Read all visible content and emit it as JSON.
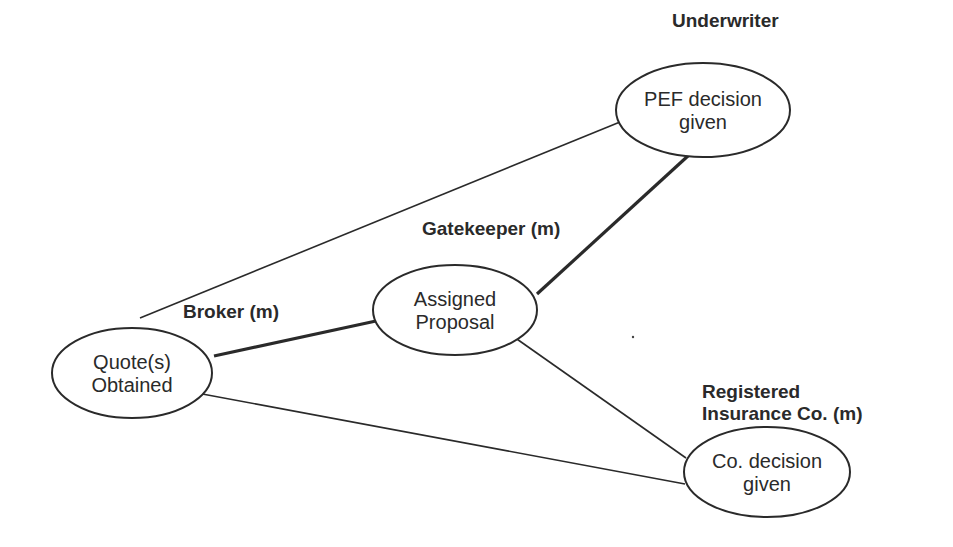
{
  "diagram": {
    "type": "process network",
    "nodes": [
      {
        "id": "quote",
        "lines": [
          "Quote(s)",
          "Obtained"
        ],
        "cx": 132,
        "cy": 373,
        "rx": 80,
        "ry": 45
      },
      {
        "id": "assigned",
        "lines": [
          "Assigned",
          "Proposal"
        ],
        "cx": 455,
        "cy": 310,
        "rx": 82,
        "ry": 45
      },
      {
        "id": "pef",
        "lines": [
          "PEF decision",
          "given"
        ],
        "cx": 703,
        "cy": 110,
        "rx": 87,
        "ry": 47
      },
      {
        "id": "co",
        "lines": [
          "Co. decision",
          "given"
        ],
        "cx": 767,
        "cy": 472,
        "rx": 83,
        "ry": 45
      }
    ],
    "roles": [
      {
        "id": "underwriter",
        "lines": [
          "Underwriter"
        ],
        "x": 672,
        "y": 27
      },
      {
        "id": "gatekeeper",
        "lines": [
          "Gatekeeper (m)"
        ],
        "x": 422,
        "y": 235
      },
      {
        "id": "broker",
        "lines": [
          "Broker (m)"
        ],
        "x": 183,
        "y": 318
      },
      {
        "id": "registered",
        "lines": [
          "Registered",
          "Insurance Co. (m)"
        ],
        "x": 702,
        "y": 398
      }
    ],
    "edges": [
      {
        "from": "quote",
        "to": "pef",
        "weight": "thin",
        "x1": 140,
        "y1": 318,
        "x2": 620,
        "y2": 122
      },
      {
        "from": "quote",
        "to": "assigned",
        "weight": "thick",
        "x1": 214,
        "y1": 356,
        "x2": 376,
        "y2": 321
      },
      {
        "from": "assigned",
        "to": "pef",
        "weight": "thick",
        "x1": 537,
        "y1": 294,
        "x2": 689,
        "y2": 155
      },
      {
        "from": "assigned",
        "to": "co",
        "weight": "thin",
        "x1": 514,
        "y1": 337,
        "x2": 686,
        "y2": 458
      },
      {
        "from": "quote",
        "to": "co",
        "weight": "thin",
        "x1": 197,
        "y1": 393,
        "x2": 685,
        "y2": 484
      }
    ],
    "colors": {
      "stroke": "#2a2a2a",
      "background": "#ffffff"
    }
  }
}
